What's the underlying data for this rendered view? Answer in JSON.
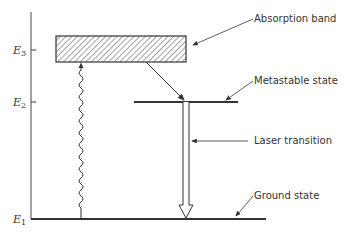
{
  "diagram": {
    "levels": [
      {
        "id": "E3",
        "symbol": "E",
        "subscript": "3",
        "label": "Absorption band"
      },
      {
        "id": "E2",
        "symbol": "E",
        "subscript": "2",
        "label": "Metastable state"
      },
      {
        "id": "E1",
        "symbol": "E",
        "subscript": "1",
        "label": "Ground state"
      }
    ],
    "transitions": [
      {
        "from": "E1",
        "to": "E3",
        "style": "wavy",
        "meaning": "pump absorption"
      },
      {
        "from": "E3",
        "to": "E2",
        "style": "thin arrow",
        "meaning": "non-radiative decay"
      },
      {
        "from": "E2",
        "to": "E1",
        "style": "hollow arrow",
        "label": "Laser transition"
      }
    ],
    "annotations": {
      "absorption_band": "Absorption band",
      "metastable_state": "Metastable state",
      "laser_transition": "Laser transition",
      "ground_state": "Ground state"
    },
    "axis_labels": {
      "e3_main": "E",
      "e3_sub": "3",
      "e2_main": "E",
      "e2_sub": "2",
      "e1_main": "E",
      "e1_sub": "1"
    }
  }
}
